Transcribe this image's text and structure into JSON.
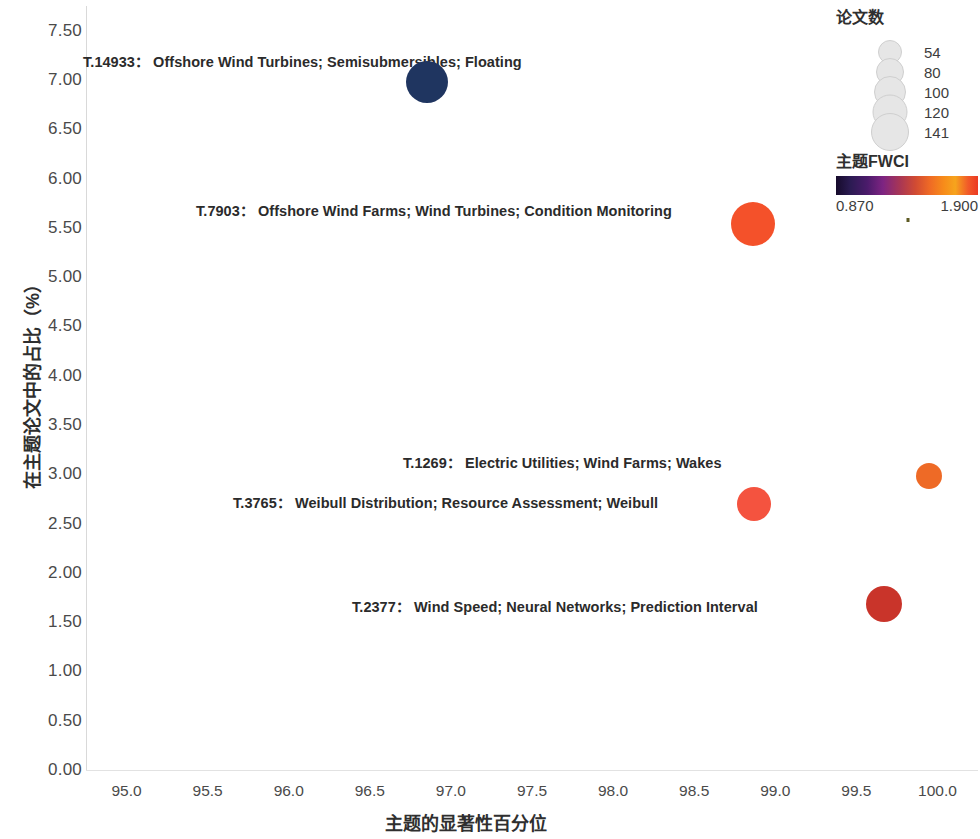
{
  "chart_data": {
    "type": "scatter",
    "title": "",
    "xlabel": "主题的显著性百分位",
    "ylabel": "在主题论文中的占比（%）",
    "xlim": [
      94.75,
      100.25
    ],
    "ylim": [
      0.0,
      7.75
    ],
    "xticks": [
      "95.0",
      "95.5",
      "96.0",
      "96.5",
      "97.0",
      "97.5",
      "98.0",
      "98.5",
      "99.0",
      "99.5",
      "100.0"
    ],
    "xtick_values": [
      95.0,
      95.5,
      96.0,
      96.5,
      97.0,
      97.5,
      98.0,
      98.5,
      99.0,
      99.5,
      100.0
    ],
    "yticks": [
      "0.00",
      "0.50",
      "1.00",
      "1.50",
      "2.00",
      "2.50",
      "3.00",
      "3.50",
      "4.00",
      "4.50",
      "5.00",
      "5.50",
      "6.00",
      "6.50",
      "7.00",
      "7.50"
    ],
    "ytick_values": [
      0.0,
      0.5,
      1.0,
      1.5,
      2.0,
      2.5,
      3.0,
      3.5,
      4.0,
      4.5,
      5.0,
      5.5,
      6.0,
      6.5,
      7.0,
      7.5
    ],
    "grid": false,
    "legend_position": "right",
    "size_variable": "论文数",
    "color_variable": "主题FWCI",
    "points": [
      {
        "id": "T.14933",
        "label": "T.14933： Offshore Wind Turbines; Semisubmersibles; Floating",
        "keywords": "Offshore Wind Turbines; Semisubmersibles; Floating",
        "x": 96.85,
        "y": 6.98,
        "papers": 141,
        "fwci": 0.87,
        "color": "#1f3560",
        "radius_px": 21,
        "label_anchor_x": 83,
        "label_anchor_y": 60
      },
      {
        "id": "T.7903",
        "label": "T.7903： Offshore Wind Farms; Wind Turbines; Condition Monitoring",
        "keywords": "Offshore Wind Farms; Wind Turbines; Condition Monitoring",
        "x": 98.86,
        "y": 5.54,
        "papers": 120,
        "fwci": 1.63,
        "color": "#f4512a",
        "radius_px": 22,
        "label_anchor_x": 196,
        "label_anchor_y": 209
      },
      {
        "id": "T.1269",
        "label": "T.1269： Electric Utilities; Wind Farms; Wakes",
        "keywords": "Electric Utilities; Wind Farms; Wakes",
        "x": 99.95,
        "y": 2.98,
        "papers": 54,
        "fwci": 1.9,
        "color": "#ee6a26",
        "radius_px": 13,
        "label_anchor_x": 403,
        "label_anchor_y": 461
      },
      {
        "id": "T.3765",
        "label": "T.3765： Weibull Distribution; Resource Assessment; Weibull",
        "keywords": "Weibull Distribution; Resource Assessment; Weibull",
        "x": 98.87,
        "y": 2.7,
        "papers": 80,
        "fwci": 1.56,
        "color": "#f4533f",
        "radius_px": 17,
        "label_anchor_x": 233,
        "label_anchor_y": 501
      },
      {
        "id": "T.2377",
        "label": "T.2377： Wind Speed; Neural Networks; Prediction Interval",
        "keywords": "Wind Speed; Neural Networks; Prediction Interval",
        "x": 99.67,
        "y": 1.68,
        "papers": 100,
        "fwci": 1.4,
        "color": "#c9342a",
        "radius_px": 18,
        "label_anchor_x": 352,
        "label_anchor_y": 605
      }
    ]
  },
  "size_legend": {
    "title": "论文数",
    "items": [
      {
        "value": "54",
        "radius_px": 11
      },
      {
        "value": "80",
        "radius_px": 13
      },
      {
        "value": "100",
        "radius_px": 15
      },
      {
        "value": "120",
        "radius_px": 16.5
      },
      {
        "value": "141",
        "radius_px": 18
      }
    ]
  },
  "color_legend": {
    "title": "主题FWCI",
    "min": "0.870",
    "max": "1.900"
  }
}
